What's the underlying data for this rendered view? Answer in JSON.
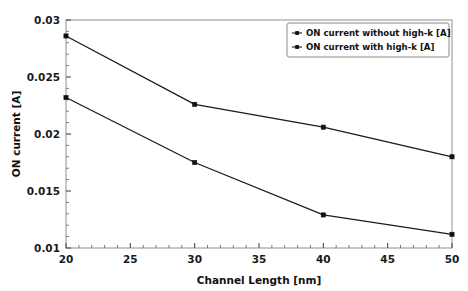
{
  "chart_data": {
    "type": "line",
    "title": "",
    "xlabel": "Channel Length [nm]",
    "ylabel": "ON current [A]",
    "x": [
      20,
      30,
      40,
      50
    ],
    "xlim": [
      20,
      50
    ],
    "ylim": [
      0.01,
      0.03
    ],
    "xticks": [
      "20",
      "25",
      "30",
      "35",
      "40",
      "45",
      "50"
    ],
    "xtick_values": [
      20,
      25,
      30,
      35,
      40,
      45,
      50
    ],
    "yticks": [
      "0.01",
      "0.015",
      "0.02",
      "0.025",
      "0.03"
    ],
    "ytick_values": [
      0.01,
      0.015,
      0.02,
      0.025,
      0.03
    ],
    "grid": false,
    "legend_position": "upper right",
    "series": [
      {
        "name": "ON current without high-k [A]",
        "values": [
          0.0286,
          0.0226,
          0.0206,
          0.018
        ],
        "color": "#111111",
        "marker": "dot"
      },
      {
        "name": "ON current with high-k [A]",
        "values": [
          0.0232,
          0.0175,
          0.0129,
          0.0112
        ],
        "color": "#111111",
        "marker": "dot"
      }
    ]
  },
  "axes": {
    "x_title": "Channel Length [nm]",
    "y_title": "ON current [A]"
  },
  "legend": {
    "entries": [
      {
        "label": "ON current without high-k [A]"
      },
      {
        "label": "ON current with high-k [A]"
      }
    ]
  }
}
